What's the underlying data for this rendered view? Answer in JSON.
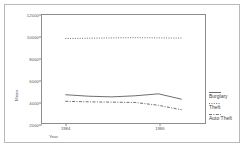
{
  "chart_data": {
    "type": "line",
    "title": "",
    "xlabel": "Year",
    "ylabel": "Mean",
    "xlim": [
      1983.5,
      1987.0
    ],
    "ylim": [
      2000,
      12000
    ],
    "yticks": [
      2000,
      4000,
      6000,
      8000,
      10000,
      12000
    ],
    "ytick_labels": [
      "2000",
      "4000",
      "6000",
      "8000",
      "10000",
      "12000"
    ],
    "xticks": [
      1984,
      1986
    ],
    "xtick_labels": [
      "1984",
      "1986"
    ],
    "grid": false,
    "legend_position": "right",
    "x": [
      1984,
      1984.5,
      1985,
      1985.5,
      1986,
      1986.5
    ],
    "series": [
      {
        "name": "Burglary",
        "style": "solid",
        "values": [
          4620,
          4480,
          4420,
          4520,
          4700,
          4200
        ]
      },
      {
        "name": "Theft",
        "style": "dotted",
        "values": [
          9820,
          9850,
          9880,
          9900,
          9880,
          9860
        ]
      },
      {
        "name": "Auto Theft",
        "style": "dash-dot",
        "values": [
          4010,
          3960,
          3930,
          3900,
          3640,
          3220
        ]
      }
    ]
  },
  "legend": {
    "items": [
      {
        "label": "Burglary",
        "style": "solid"
      },
      {
        "label": "Theft",
        "style": "dotted"
      },
      {
        "label": "Auto Theft",
        "style": "dash-dot"
      }
    ]
  },
  "axes": {
    "y_title": "Mean",
    "x_title": "Year"
  }
}
